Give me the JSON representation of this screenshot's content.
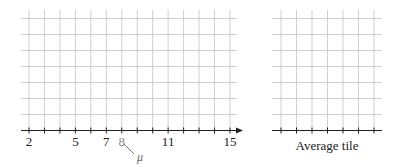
{
  "left_panel": {
    "x_ticks": [
      2,
      3,
      4,
      5,
      6,
      7,
      8,
      9,
      10,
      11,
      12,
      13,
      14,
      15
    ],
    "tick_labels": [
      {
        "value": 2,
        "text": "2",
        "grey": false
      },
      {
        "value": 5,
        "text": "5",
        "grey": false
      },
      {
        "value": 7,
        "text": "7",
        "grey": false
      },
      {
        "value": 8,
        "text": "8",
        "grey": true
      },
      {
        "value": 11,
        "text": "11",
        "grey": false
      },
      {
        "value": 15,
        "text": "15",
        "grey": false
      }
    ],
    "annotation": {
      "text": "μ",
      "points_to": "8"
    },
    "grid_rows": 7
  },
  "right_panel": {
    "tick_count": 7,
    "grid_rows": 7,
    "caption": "Average tile"
  },
  "colors": {
    "grid": "#cfcfcf",
    "axis": "#222222",
    "grey_label": "#888888"
  }
}
